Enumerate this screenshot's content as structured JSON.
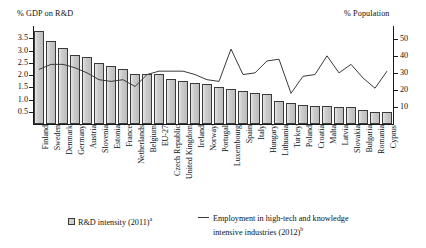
{
  "axes": {
    "left_title": "% GDP on R&D",
    "right_title": "% Population",
    "left_ticks": [
      "0.5",
      "1.0",
      "1.5",
      "2.0",
      "2.5",
      "3.0",
      "3.5"
    ],
    "right_ticks": [
      "10",
      "20",
      "30",
      "40",
      "50"
    ]
  },
  "legend": {
    "bar_label": "R&D intensity (2011)",
    "bar_sup": "a",
    "line_label_line1": "Employment in high-tech and knowledge",
    "line_label_line2": "intensive industries (2012)",
    "line_sup": "b"
  },
  "colors": {
    "bar_fill": "#c9c9c9",
    "bar_stroke": "#3a3a3a",
    "line_stroke": "#3a3a3a",
    "axis": "#1a1a1a",
    "text": "#111111",
    "background": "#ffffff"
  },
  "chart_data": {
    "type": "bar",
    "title": "",
    "xlabel": "",
    "ylabel": "% GDP on R&D",
    "y2label": "% Population",
    "ylim": [
      0,
      4.0
    ],
    "y2lim": [
      0,
      57.5
    ],
    "ytick_values": [
      0.5,
      1.0,
      1.5,
      2.0,
      2.5,
      3.0,
      3.5
    ],
    "y2tick_values": [
      10,
      20,
      30,
      40,
      50
    ],
    "grid": false,
    "legend_position": "bottom",
    "categories": [
      "Finland",
      "Sweden",
      "Denmark",
      "Germany",
      "Austria",
      "Slovenia",
      "Estonia",
      "France",
      "Netherlands",
      "Belgium",
      "EU-27",
      "Czech Republic",
      "United Kingdom",
      "Ireland",
      "Norway",
      "Portugal",
      "Luxembourg",
      "Spain",
      "Italy",
      "Hungary",
      "Lithuania",
      "Turkey",
      "Poland",
      "Croatia",
      "Malta",
      "Latvia",
      "Slovakia",
      "Bulgaria",
      "Romania",
      "Cyprus"
    ],
    "series": [
      {
        "name": "R&D intensity (2011)",
        "type": "bar",
        "axis": "left",
        "unit": "% GDP",
        "values": [
          3.8,
          3.37,
          3.09,
          2.8,
          2.75,
          2.47,
          2.38,
          2.25,
          2.05,
          2.04,
          2.03,
          1.84,
          1.77,
          1.68,
          1.65,
          1.5,
          1.43,
          1.33,
          1.25,
          1.21,
          0.92,
          0.86,
          0.77,
          0.75,
          0.73,
          0.7,
          0.68,
          0.57,
          0.48,
          0.48
        ]
      },
      {
        "name": "Employment in high-tech and knowledge intensive industries (2012)",
        "type": "line",
        "axis": "right",
        "unit": "% Population",
        "values": [
          32,
          35,
          35,
          33,
          30,
          26,
          25,
          26,
          22,
          29,
          31,
          31,
          31,
          29,
          26,
          25,
          44,
          29,
          30,
          37,
          38,
          18,
          28,
          29,
          40,
          30,
          35,
          27,
          21,
          31
        ]
      }
    ]
  }
}
